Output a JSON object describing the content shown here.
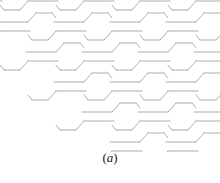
{
  "figure": {
    "caption_prefix": "(",
    "caption_letter": "a",
    "caption_suffix": ")",
    "caption_full": "(a)",
    "alt_description": "Periodic tessellation of interlocking Z-shaped hexagonal tiles"
  },
  "style": {
    "background_color": "#ffffff",
    "line_color": "#8a8a8a",
    "line_width": 0.7,
    "caption_color": "#1a1a1a"
  },
  "chart_data": {
    "type": "diagram",
    "title": "(a)",
    "pattern": "zigzag-hexagon-tessellation",
    "canvas": {
      "width": 220,
      "height": 152
    },
    "lattice": {
      "period_x": 56,
      "period_y": 30,
      "row_offset_x": 28,
      "rows": 6,
      "cols": 6,
      "origin_x": -30,
      "origin_y": -8
    },
    "tile_outline_points": [
      [
        0,
        0
      ],
      [
        30,
        0
      ],
      [
        38,
        -9
      ],
      [
        54,
        -9
      ],
      [
        56,
        -6
      ],
      [
        56,
        0
      ],
      [
        26,
        0
      ],
      [
        18,
        9
      ],
      [
        2,
        9
      ],
      [
        0,
        6
      ]
    ],
    "tile_path_segments": [
      {
        "name": "top-long-edge",
        "from": [
          0,
          0
        ],
        "to": [
          30,
          0
        ]
      },
      {
        "name": "upper-right-diagonal",
        "from": [
          30,
          0
        ],
        "to": [
          38,
          -9
        ]
      },
      {
        "name": "upper-notch-edge",
        "from": [
          38,
          -9
        ],
        "to": [
          54,
          -9
        ]
      },
      {
        "name": "upper-right-short-diagonal",
        "from": [
          54,
          -9
        ],
        "to": [
          58,
          -4
        ]
      },
      {
        "name": "bottom-long-edge",
        "from": [
          2,
          9
        ],
        "to": [
          32,
          9
        ]
      },
      {
        "name": "lower-left-diagonal",
        "from": [
          2,
          9
        ],
        "to": [
          -6,
          18
        ]
      },
      {
        "name": "lower-notch-edge",
        "from": [
          -6,
          18
        ],
        "to": [
          -22,
          18
        ]
      },
      {
        "name": "lower-left-short-diagonal",
        "from": [
          -22,
          18
        ],
        "to": [
          -26,
          13
        ]
      }
    ]
  }
}
